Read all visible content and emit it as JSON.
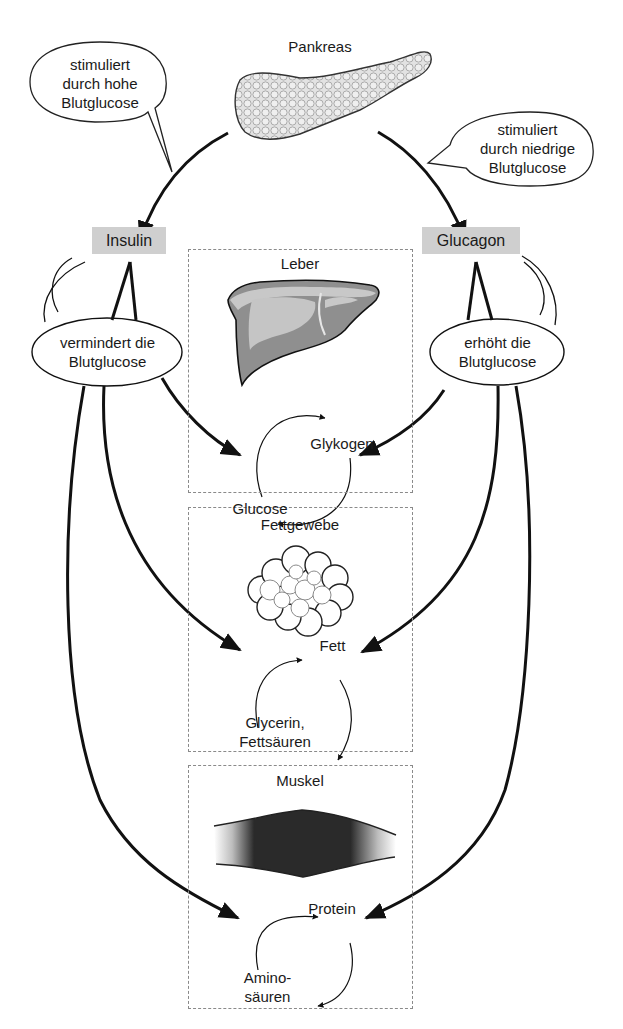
{
  "diagram": {
    "title_organ": "Pankreas",
    "speech_bubbles": {
      "left_top": [
        "stimuliert",
        "durch hohe",
        "Blutglucose"
      ],
      "right_top": [
        "stimuliert",
        "durch niedrige",
        "Blutglucose"
      ],
      "left_effect": [
        "vermindert die",
        "Blutglucose"
      ],
      "right_effect": [
        "erhöht die",
        "Blutglucose"
      ]
    },
    "hormones": {
      "left": "Insulin",
      "right": "Glucagon",
      "label_fill_color": "#cfcfcf"
    },
    "organs": [
      {
        "name": "Leber",
        "cycle": {
          "top": "Glykogen",
          "bottom": "Glucose"
        }
      },
      {
        "name": "Fettgewebe",
        "cycle": {
          "top": "Fett",
          "bottom_line1": "Glycerin,",
          "bottom_line2": "Fettsäuren"
        }
      },
      {
        "name": "Muskel",
        "cycle": {
          "top": "Protein",
          "bottom_line1": "Amino-",
          "bottom_line2": "säuren"
        }
      }
    ],
    "colors": {
      "arrow": "#111111",
      "liver_fill": "#8f8f8f",
      "liver_highlight": "#c8c8c8",
      "box_border": "#8a8a8a"
    }
  }
}
